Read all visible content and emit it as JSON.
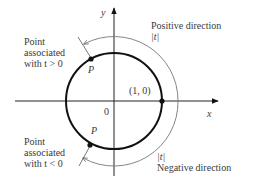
{
  "diagram": {
    "axes": {
      "x_label": "x",
      "y_label": "y",
      "origin_label": "0"
    },
    "unit_point_label": "(1, 0)",
    "point_positive": {
      "marker_label": "P",
      "caption_lines": [
        "Point",
        "associated",
        "with t > 0"
      ]
    },
    "point_negative": {
      "marker_label": "P",
      "caption_lines": [
        "Point",
        "associated",
        "with t < 0"
      ]
    },
    "positive_direction": {
      "title": "Positive direction",
      "arc_label": "|t|"
    },
    "negative_direction": {
      "title": "Negative direction",
      "arc_label": "|t|"
    },
    "colors": {
      "circle": "#111111",
      "axes": "#222222",
      "arcs": "#777777",
      "text": "#3a3a3a"
    }
  }
}
